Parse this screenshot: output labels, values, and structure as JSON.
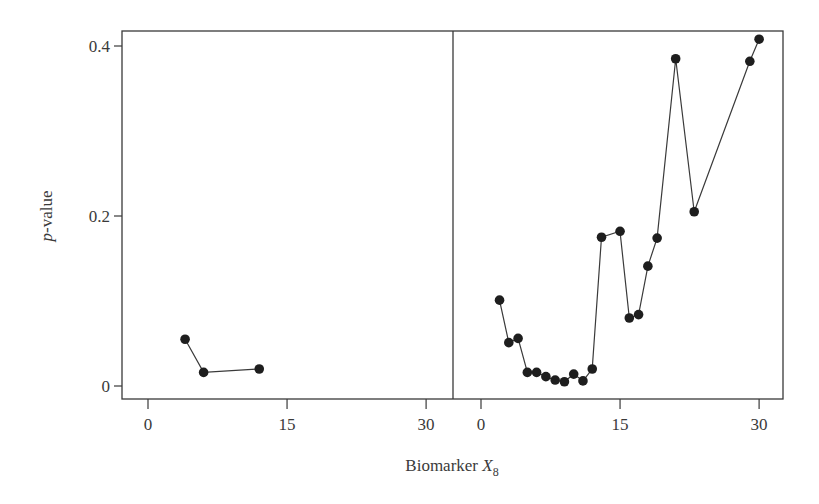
{
  "chart_data": {
    "type": "line",
    "title": "",
    "xlabel": "Biomarker X8",
    "xlabel_main": "Biomarker ",
    "xlabel_var": "X",
    "xlabel_sub": "8",
    "ylabel": "p-value",
    "ylabel_italic": "p",
    "ylabel_rest": "-value",
    "ylim": [
      0,
      0.4
    ],
    "yticks": [
      0,
      0.2,
      0.4
    ],
    "ytick_labels": [
      "0",
      "0.2",
      "0.4"
    ],
    "grid": false,
    "legend": "none",
    "panels": [
      {
        "name": "left",
        "xlim": [
          0,
          30
        ],
        "xticks": [
          0,
          15,
          30
        ],
        "xtick_labels": [
          "0",
          "15",
          "30"
        ],
        "series": [
          {
            "name": "p-value",
            "x": [
              4,
              6,
              12
            ],
            "y": [
              0.055,
              0.016,
              0.02
            ]
          }
        ]
      },
      {
        "name": "right",
        "xlim": [
          0,
          30
        ],
        "xticks": [
          0,
          15,
          30
        ],
        "xtick_labels": [
          "0",
          "15",
          "30"
        ],
        "series": [
          {
            "name": "p-value",
            "x": [
              2,
              3,
              4,
              5,
              6,
              7,
              8,
              9,
              10,
              11,
              12,
              13,
              15,
              16,
              17,
              18,
              19,
              21,
              23,
              29,
              30
            ],
            "y": [
              0.101,
              0.051,
              0.056,
              0.016,
              0.016,
              0.011,
              0.007,
              0.005,
              0.014,
              0.006,
              0.02,
              0.175,
              0.182,
              0.08,
              0.084,
              0.141,
              0.174,
              0.385,
              0.205,
              0.382,
              0.408
            ]
          }
        ]
      }
    ]
  },
  "colors": {
    "line": "#3a3a3a",
    "marker": "#1e1e1e",
    "axis": "#3a3a3a"
  }
}
